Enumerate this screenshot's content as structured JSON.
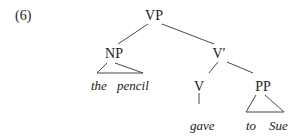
{
  "example_number": "(6)",
  "tree": {
    "root": "VP",
    "nodes": {
      "vp": "VP",
      "np": "NP",
      "vbar": "V′",
      "v": "V",
      "pp": "PP"
    },
    "leaves": {
      "np_the": "the",
      "np_pencil": "pencil",
      "v_gave": "gave",
      "pp_to": "to",
      "pp_sue": "Sue"
    },
    "structure": "[VP [NP the pencil] [V′ [V gave] [PP to Sue]]]"
  }
}
